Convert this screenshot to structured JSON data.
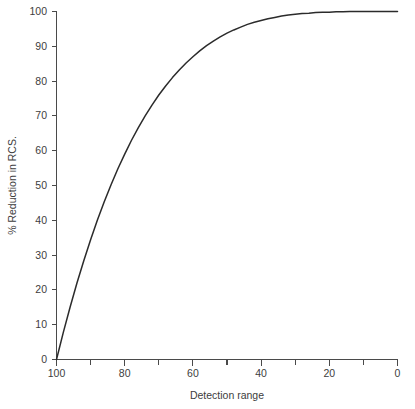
{
  "chart_data": {
    "type": "line",
    "title": "",
    "xlabel": "Detection range",
    "ylabel": "% Reduction in RCS.",
    "xlim": [
      100,
      0
    ],
    "ylim": [
      0,
      100
    ],
    "x_axis_reversed": true,
    "grid": false,
    "legend": "none",
    "x_tick_labels": [
      "100",
      "80",
      "60",
      "40",
      "20",
      "0"
    ],
    "x_tick_values": [
      100,
      80,
      60,
      40,
      20,
      0
    ],
    "x_minor_tick_values": [
      90,
      70,
      50,
      30,
      10
    ],
    "y_tick_labels": [
      "0",
      "10",
      "20",
      "30",
      "40",
      "50",
      "60",
      "70",
      "80",
      "90",
      "100"
    ],
    "y_tick_values": [
      0,
      10,
      20,
      30,
      40,
      50,
      60,
      70,
      80,
      90,
      100
    ],
    "series": [
      {
        "name": "% Reduction in RCS",
        "x": [
          100,
          98,
          96,
          94,
          92,
          90,
          88,
          86,
          84,
          82,
          80,
          78,
          76,
          74,
          72,
          70,
          68,
          66,
          64,
          62,
          60,
          58,
          56,
          54,
          52,
          50,
          48,
          46,
          44,
          42,
          40,
          38,
          36,
          34,
          32,
          30,
          28,
          26,
          24,
          22,
          20,
          18,
          16,
          14,
          12,
          10,
          8,
          6,
          4,
          2,
          0
        ],
        "values": [
          0,
          7.8,
          15.1,
          22.0,
          28.4,
          34.4,
          40.1,
          45.3,
          50.2,
          54.8,
          59.0,
          63.0,
          66.6,
          70.0,
          73.1,
          76.0,
          78.6,
          81.0,
          83.2,
          85.2,
          87.0,
          88.7,
          90.2,
          91.5,
          92.7,
          93.8,
          94.7,
          95.5,
          96.3,
          96.9,
          97.4,
          97.9,
          98.3,
          98.7,
          99.0,
          99.2,
          99.4,
          99.5,
          99.7,
          99.8,
          99.8,
          99.9,
          99.9,
          100,
          100,
          100,
          100,
          100,
          100,
          100,
          100
        ]
      }
    ],
    "relation": "reduction = 100 * (1 - (range/100)^4)",
    "colors": {
      "curve": "#2b2b2b",
      "axis": "#4a4a4a",
      "text": "#3d3d3d",
      "background": "#ffffff"
    }
  }
}
